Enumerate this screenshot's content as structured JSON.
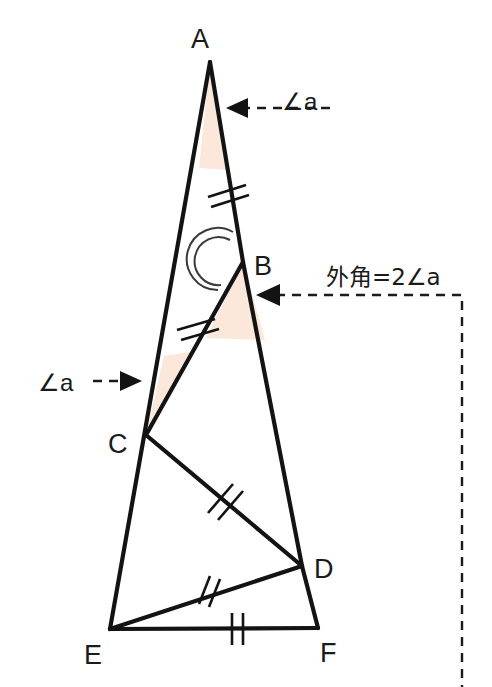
{
  "figure": {
    "width": 492,
    "height": 687,
    "background_color": "#ffffff",
    "line_color": "#131313",
    "shade_color": "#fbe8da",
    "vertices": [
      {
        "name": "A",
        "label": "A",
        "x": 210,
        "y": 62,
        "label_x": 200,
        "label_y": 48
      },
      {
        "name": "B",
        "label": "B",
        "x": 243,
        "y": 262,
        "label_x": 254,
        "label_y": 266
      },
      {
        "name": "C",
        "label": "C",
        "x": 146,
        "y": 435,
        "label_x": 116,
        "label_y": 447
      },
      {
        "name": "D",
        "label": "D",
        "x": 302,
        "y": 566,
        "label_x": 314,
        "label_y": 572
      },
      {
        "name": "E",
        "label": "E",
        "x": 110,
        "y": 629,
        "label_x": 92,
        "label_y": 657
      },
      {
        "name": "F",
        "label": "F",
        "x": 318,
        "y": 628,
        "label_x": 324,
        "label_y": 655
      }
    ],
    "segments": [
      {
        "name": "segment-AE",
        "from": "A",
        "to": "E"
      },
      {
        "name": "segment-AB",
        "from": "A",
        "to": "B"
      },
      {
        "name": "segment-BD",
        "from": "B",
        "to": "D"
      },
      {
        "name": "segment-DF",
        "from": "D",
        "to": "F"
      },
      {
        "name": "segment-BC",
        "from": "B",
        "to": "C"
      },
      {
        "name": "segment-CD",
        "from": "C",
        "to": "D"
      },
      {
        "name": "segment-DE",
        "from": "D",
        "to": "E"
      },
      {
        "name": "segment-EF",
        "from": "E",
        "to": "F"
      }
    ],
    "equal_marks": [
      {
        "name": "tick-AB",
        "segment": "AB",
        "count": 2
      },
      {
        "name": "tick-BC",
        "segment": "BC",
        "count": 2
      },
      {
        "name": "tick-CD",
        "segment": "CD",
        "count": 2
      },
      {
        "name": "tick-DE",
        "segment": "DE",
        "count": 2
      },
      {
        "name": "tick-EF",
        "segment": "EF",
        "count": 2
      }
    ],
    "shaded_angles": [
      {
        "name": "shaded-angle-A",
        "at": "A"
      },
      {
        "name": "shaded-angle-B",
        "at": "B"
      },
      {
        "name": "shaded-angle-C",
        "at": "C"
      }
    ],
    "arc_marks": [
      {
        "name": "reflex-arc-B",
        "at": "B",
        "arcs": 2
      }
    ]
  },
  "annotations": {
    "angle_a_top": {
      "label": "∠a",
      "text_x": 282,
      "text_y": 110,
      "arrow_direction": "left",
      "arrow_tip_x": 230,
      "arrow_tip_y": 108,
      "arrow_tail_x": 330,
      "arrow_tail_y": 108
    },
    "angle_a_left": {
      "label": "∠a",
      "text_x": 42,
      "text_y": 385,
      "arrow_direction": "right",
      "arrow_tip_x": 140,
      "arrow_tip_y": 381,
      "arrow_tail_x": 95,
      "arrow_tail_y": 381
    },
    "exterior_angle": {
      "label": "外角=2∠a",
      "text_x": 330,
      "text_y": 283,
      "arrow_direction": "left",
      "arrow_tip_x": 258,
      "arrow_tip_y": 295,
      "corner_x": 462,
      "corner_y": 295,
      "drop_to_y": 687
    }
  }
}
